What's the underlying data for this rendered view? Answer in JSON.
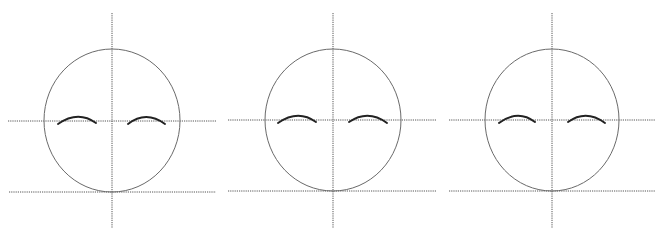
{
  "diagram": {
    "colors": {
      "background": "#ffffff",
      "guide_line": "#555555",
      "head_outline": "#6a6a6a",
      "eyebrow": "#222222"
    },
    "panels": [
      {
        "id": "panel-1",
        "head": {
          "cx": 112,
          "cy": 120.5,
          "rx": 68,
          "ry": 71.5
        },
        "vertical_guide": {
          "x": 112,
          "y1": 13,
          "y2": 228
        },
        "eye_guide": {
          "y": 121,
          "x1": 8,
          "x2": 216
        },
        "chin_guide": {
          "y": 192,
          "x1": 9,
          "x2": 216
        },
        "brows": [
          {
            "side": "left",
            "path": "M58,124 Q78,110 96,123"
          },
          {
            "side": "right",
            "path": "M128,124 Q146,110 165,124"
          }
        ]
      },
      {
        "id": "panel-2",
        "head": {
          "cx": 333,
          "cy": 120,
          "rx": 68,
          "ry": 71
        },
        "vertical_guide": {
          "x": 333,
          "y1": 13,
          "y2": 228
        },
        "eye_guide": {
          "y": 120,
          "x1": 228,
          "x2": 437
        },
        "chin_guide": {
          "y": 191,
          "x1": 228,
          "x2": 437
        },
        "brows": [
          {
            "side": "left",
            "path": "M278,123 Q298,109 316,122"
          },
          {
            "side": "right",
            "path": "M349,122 Q368,109 387,123"
          }
        ]
      },
      {
        "id": "panel-3",
        "head": {
          "cx": 552,
          "cy": 120,
          "rx": 67,
          "ry": 71
        },
        "vertical_guide": {
          "x": 552,
          "y1": 13,
          "y2": 228
        },
        "eye_guide": {
          "y": 120,
          "x1": 449,
          "x2": 655
        },
        "chin_guide": {
          "y": 191,
          "x1": 449,
          "x2": 655
        },
        "brows": [
          {
            "side": "left",
            "path": "M499,123 Q518,109 535,122"
          },
          {
            "side": "right",
            "path": "M568,122 Q586,109 605,123"
          }
        ]
      }
    ]
  }
}
